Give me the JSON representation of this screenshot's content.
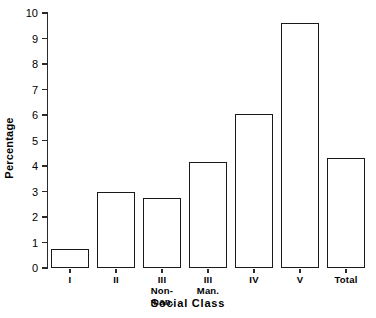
{
  "chart_data": {
    "type": "bar",
    "title": "",
    "xlabel": "Social Class",
    "ylabel": "Percentage",
    "categories": [
      "I",
      "II",
      "III Non-man.",
      "III Man.",
      "IV",
      "V",
      "Total"
    ],
    "category_labels": [
      {
        "line1": "I",
        "line2": ""
      },
      {
        "line1": "II",
        "line2": ""
      },
      {
        "line1": "III",
        "line2": "Non-man."
      },
      {
        "line1": "III",
        "line2": "Man."
      },
      {
        "line1": "IV",
        "line2": ""
      },
      {
        "line1": "V",
        "line2": ""
      },
      {
        "line1": "Total",
        "line2": ""
      }
    ],
    "values": [
      0.75,
      3.0,
      2.75,
      4.15,
      6.05,
      9.6,
      4.3
    ],
    "ylim": [
      0,
      10
    ],
    "yticks": [
      0,
      1,
      2,
      3,
      4,
      5,
      6,
      7,
      8,
      9,
      10
    ],
    "ytick_labels": [
      "0",
      "1",
      "2",
      "3",
      "4",
      "5",
      "6",
      "7",
      "8",
      "9",
      "10"
    ],
    "grid": false,
    "legend": null,
    "bar_style": {
      "fill": "#ffffff",
      "edge": "#1a1a1a"
    },
    "axis_color": "#2a2a2a"
  }
}
